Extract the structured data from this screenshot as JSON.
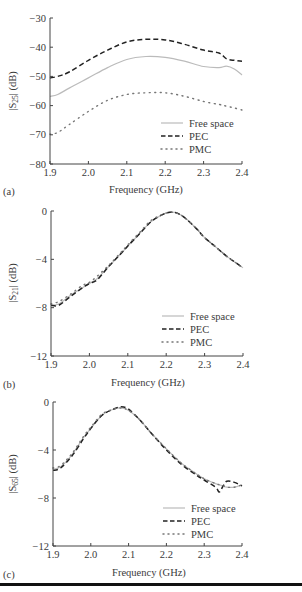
{
  "figure": {
    "bottom_rule_color": "#111111"
  },
  "chart_data": [
    {
      "type": "line",
      "panel_label": "(a)",
      "title": "",
      "xlabel": "Frequency (GHz)",
      "ylabel": "|S25| (dB)",
      "ylabel_main": "|S",
      "ylabel_sub": "25",
      "ylabel_tail": "| (dB)",
      "xlim": [
        1.9,
        2.4
      ],
      "ylim": [
        -80,
        -30
      ],
      "xticks": [
        "1.9",
        "2.0",
        "2.1",
        "2.2",
        "2.3",
        "2.4"
      ],
      "yticks": [
        "−30",
        "−40",
        "−50",
        "−60",
        "−70",
        "−80"
      ],
      "grid": false,
      "legend_position": "lower right",
      "x": [
        1.9,
        1.92,
        1.95,
        2.0,
        2.05,
        2.1,
        2.15,
        2.2,
        2.25,
        2.3,
        2.34,
        2.36,
        2.38,
        2.4
      ],
      "series": [
        {
          "name": "Free space",
          "style": "solid",
          "color": "#bbbbbb",
          "values": [
            -56.8,
            -56.2,
            -54.0,
            -50.5,
            -47.0,
            -44.2,
            -43.2,
            -43.5,
            -44.8,
            -46.6,
            -47.0,
            -46.5,
            -47.5,
            -49.5
          ]
        },
        {
          "name": "PEC",
          "style": "dashed",
          "color": "#222222",
          "values": [
            -50.5,
            -50.0,
            -48.5,
            -44.5,
            -41.0,
            -38.2,
            -37.3,
            -37.5,
            -39.0,
            -41.0,
            -42.0,
            -44.0,
            -44.5,
            -44.8
          ]
        },
        {
          "name": "PMC",
          "style": "dotted",
          "color": "#777777",
          "values": [
            -69.8,
            -69.2,
            -66.5,
            -62.0,
            -58.2,
            -56.2,
            -55.6,
            -55.6,
            -56.8,
            -58.6,
            -59.6,
            -60.2,
            -60.8,
            -61.5
          ]
        }
      ]
    },
    {
      "type": "line",
      "panel_label": "(b)",
      "title": "",
      "xlabel": "Frequency (GHz)",
      "ylabel": "|S21| (dB)",
      "ylabel_main": "|S",
      "ylabel_sub": "21",
      "ylabel_tail": "| (dB)",
      "xlim": [
        1.9,
        2.4
      ],
      "ylim": [
        -12,
        0
      ],
      "xticks": [
        "1.9",
        "2.0",
        "2.1",
        "2.2",
        "2.3",
        "2.4"
      ],
      "yticks": [
        "0",
        "−4",
        "−8",
        "−12"
      ],
      "grid": false,
      "legend_position": "lower right",
      "x": [
        1.9,
        1.92,
        1.95,
        1.98,
        2.0,
        2.02,
        2.05,
        2.08,
        2.1,
        2.13,
        2.16,
        2.19,
        2.21,
        2.23,
        2.25,
        2.28,
        2.3,
        2.33,
        2.36,
        2.4
      ],
      "series": [
        {
          "name": "Free space",
          "style": "solid",
          "color": "#bbbbbb",
          "values": [
            -7.8,
            -7.7,
            -7.0,
            -6.4,
            -6.0,
            -5.6,
            -4.6,
            -3.6,
            -2.9,
            -1.9,
            -0.9,
            -0.3,
            -0.1,
            -0.2,
            -0.6,
            -1.5,
            -2.2,
            -3.0,
            -3.8,
            -4.7
          ]
        },
        {
          "name": "PEC",
          "style": "dashed",
          "color": "#222222",
          "values": [
            -7.8,
            -7.8,
            -7.1,
            -6.4,
            -6.0,
            -5.7,
            -4.6,
            -3.6,
            -2.9,
            -1.9,
            -0.9,
            -0.3,
            -0.1,
            -0.2,
            -0.6,
            -1.5,
            -2.2,
            -3.0,
            -3.8,
            -4.7
          ]
        },
        {
          "name": "PMC",
          "style": "dotted",
          "color": "#777777",
          "values": [
            -7.7,
            -7.5,
            -6.9,
            -6.2,
            -5.9,
            -5.4,
            -4.5,
            -3.5,
            -2.8,
            -1.8,
            -0.8,
            -0.3,
            -0.1,
            -0.2,
            -0.6,
            -1.5,
            -2.2,
            -3.0,
            -3.8,
            -4.7
          ]
        }
      ]
    },
    {
      "type": "line",
      "panel_label": "(c)",
      "title": "",
      "xlabel": "Frequency (GHz)",
      "ylabel": "|S65| (dB)",
      "ylabel_main": "|S",
      "ylabel_sub": "65",
      "ylabel_tail": "| (dB)",
      "xlim": [
        1.9,
        2.4
      ],
      "ylim": [
        -12,
        0
      ],
      "xticks": [
        "1.9",
        "2.0",
        "2.1",
        "2.2",
        "2.3",
        "2.4"
      ],
      "yticks": [
        "0",
        "−4",
        "−8",
        "−12"
      ],
      "grid": false,
      "legend_position": "lower right",
      "x": [
        1.9,
        1.92,
        1.95,
        1.98,
        2.0,
        2.03,
        2.06,
        2.08,
        2.1,
        2.13,
        2.16,
        2.2,
        2.24,
        2.28,
        2.3,
        2.33,
        2.34,
        2.35,
        2.36,
        2.38,
        2.4
      ],
      "series": [
        {
          "name": "Free space",
          "style": "solid",
          "color": "#bbbbbb",
          "values": [
            -5.6,
            -5.4,
            -4.4,
            -3.0,
            -2.2,
            -1.1,
            -0.6,
            -0.5,
            -0.7,
            -1.5,
            -2.6,
            -3.9,
            -5.1,
            -6.0,
            -6.4,
            -6.8,
            -6.9,
            -7.0,
            -7.1,
            -7.1,
            -6.9
          ]
        },
        {
          "name": "PEC",
          "style": "dashed",
          "color": "#222222",
          "values": [
            -5.7,
            -5.5,
            -4.5,
            -3.1,
            -2.2,
            -1.1,
            -0.6,
            -0.4,
            -0.6,
            -1.5,
            -2.6,
            -4.0,
            -5.2,
            -6.1,
            -6.5,
            -7.1,
            -7.5,
            -7.0,
            -6.6,
            -6.7,
            -7.0
          ]
        },
        {
          "name": "PMC",
          "style": "dotted",
          "color": "#777777",
          "values": [
            -5.5,
            -5.3,
            -4.3,
            -2.9,
            -2.1,
            -1.0,
            -0.6,
            -0.5,
            -0.7,
            -1.5,
            -2.6,
            -3.9,
            -5.1,
            -6.0,
            -6.4,
            -6.8,
            -6.9,
            -7.0,
            -7.1,
            -7.1,
            -6.9
          ]
        }
      ]
    }
  ]
}
